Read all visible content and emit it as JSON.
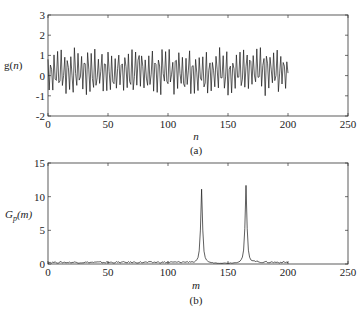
{
  "chart_data": [
    {
      "type": "line",
      "panel_label": "(a)",
      "title": "",
      "xlabel": "n",
      "ylabel": "g(n)",
      "xlim": [
        0,
        250
      ],
      "ylim": [
        -2,
        3
      ],
      "xticks": [
        0,
        50,
        100,
        150,
        200,
        250
      ],
      "yticks": [
        -2,
        -1,
        0,
        1,
        2,
        3
      ],
      "grid": false,
      "description": "Noisy multi-tone signal g(n), n = 0..200, amplitude roughly between -1.8 and 2.2",
      "series": [
        {
          "name": "g(n)",
          "x_range": [
            0,
            200
          ],
          "n_points": 201,
          "approx_min": -1.8,
          "approx_max": 2.2,
          "components_freq_bins": [
            128,
            165
          ]
        }
      ]
    },
    {
      "type": "line",
      "panel_label": "(b)",
      "title": "",
      "xlabel": "m",
      "ylabel": "Gp(m)",
      "xlim": [
        0,
        250
      ],
      "ylim": [
        0,
        15
      ],
      "xticks": [
        0,
        50,
        100,
        150,
        200,
        250
      ],
      "yticks": [
        0,
        5,
        10,
        15
      ],
      "grid": false,
      "description": "Spectrum Gp(m) with two sharp peaks over low noise floor",
      "series": [
        {
          "name": "Gp(m)",
          "x_range": [
            0,
            200
          ],
          "noise_floor": 0.3,
          "peaks": [
            {
              "m": 128,
              "value": 11.0
            },
            {
              "m": 165,
              "value": 11.6
            }
          ]
        }
      ]
    }
  ],
  "panels": {
    "a": {
      "ylabel_main": "g(",
      "ylabel_var": "n",
      "ylabel_end": ")",
      "xlabel": "n",
      "caption": "(a)"
    },
    "b": {
      "ylabel_main": "G",
      "ylabel_sub": "p",
      "ylabel_rest": "(m)",
      "xlabel": "m",
      "caption": "(b)"
    }
  },
  "colors": {
    "line": "#1a1a1a",
    "axis": "#333333",
    "background": "#ffffff"
  }
}
